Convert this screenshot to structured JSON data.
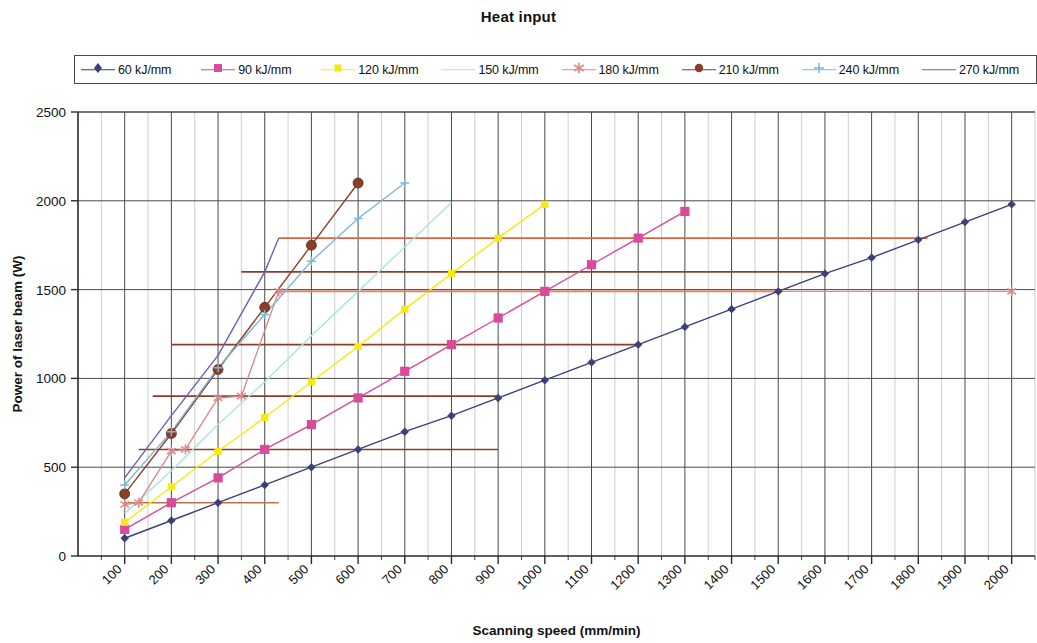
{
  "title": "Heat input",
  "legend": {
    "items": [
      {
        "label": "60 kJ/mm",
        "color": "#3b3f7a",
        "marker": "diamond"
      },
      {
        "label": "90 kJ/mm",
        "color": "#d94a9c",
        "marker": "square"
      },
      {
        "label": "120 kJ/mm",
        "color": "#f6ea12",
        "marker": "square-small"
      },
      {
        "label": "150 kJ/mm",
        "color": "#a8e4e4",
        "marker": "none"
      },
      {
        "label": "180 kJ/mm",
        "color": "#d98a8a",
        "marker": "star"
      },
      {
        "label": "210 kJ/mm",
        "color": "#8a3f2a",
        "marker": "circle"
      },
      {
        "label": "240 kJ/mm",
        "color": "#7fb7d4",
        "marker": "plus"
      },
      {
        "label": "270 kJ/mm",
        "color": "#6b62b5",
        "marker": "none"
      }
    ]
  },
  "chart_data": {
    "type": "line",
    "title": "Heat input",
    "xlabel": "Scanning speed (mm/min)",
    "ylabel": "Power of laser beam (W)",
    "xlim": [
      0,
      2050
    ],
    "ylim": [
      0,
      2500
    ],
    "xticks": [
      100,
      200,
      300,
      400,
      500,
      600,
      700,
      800,
      900,
      1000,
      1100,
      1200,
      1300,
      1400,
      1500,
      1600,
      1700,
      1800,
      1900,
      2000
    ],
    "yticks": [
      0,
      500,
      1000,
      1500,
      2000,
      2500
    ],
    "grid": true,
    "legend_position": "top",
    "series": [
      {
        "name": "60 kJ/mm",
        "color": "#3b3f7a",
        "marker": "diamond",
        "x": [
          100,
          200,
          300,
          400,
          500,
          600,
          700,
          800,
          900,
          1000,
          1100,
          1200,
          1300,
          1400,
          1500,
          1600,
          1700,
          1800,
          1900,
          2000
        ],
        "y": [
          100,
          200,
          300,
          400,
          500,
          600,
          700,
          790,
          890,
          990,
          1090,
          1190,
          1290,
          1390,
          1490,
          1590,
          1680,
          1780,
          1880,
          1980
        ]
      },
      {
        "name": "90 kJ/mm",
        "color": "#d94a9c",
        "marker": "square",
        "x": [
          100,
          200,
          300,
          400,
          500,
          600,
          700,
          800,
          900,
          1000,
          1100,
          1200,
          1300
        ],
        "y": [
          150,
          300,
          440,
          600,
          740,
          890,
          1040,
          1190,
          1340,
          1490,
          1640,
          1790,
          1940
        ]
      },
      {
        "name": "120 kJ/mm",
        "color": "#f6ea12",
        "marker": "square-small",
        "x": [
          100,
          200,
          300,
          400,
          500,
          600,
          700,
          800,
          900,
          1000
        ],
        "y": [
          190,
          390,
          590,
          780,
          980,
          1180,
          1390,
          1590,
          1790,
          1980
        ]
      },
      {
        "name": "150 kJ/mm",
        "color": "#a8e4e4",
        "marker": "none",
        "x": [
          100,
          200,
          300,
          400,
          500,
          600,
          700,
          800
        ],
        "y": [
          240,
          480,
          740,
          980,
          1240,
          1490,
          1740,
          1990
        ]
      },
      {
        "name": "180 kJ/mm",
        "color": "#d98a8a",
        "marker": "star",
        "x": [
          100,
          130,
          200,
          230,
          300,
          350,
          430,
          2000
        ],
        "y": [
          290,
          300,
          590,
          600,
          890,
          900,
          1490,
          1490
        ],
        "note": "rises then plateaus; also forms stepped horizontal segments at 300, 600, 900, 1190, 1490"
      },
      {
        "name": "210 kJ/mm",
        "color": "#8a3f2a",
        "marker": "circle",
        "x": [
          100,
          200,
          300,
          400,
          500,
          600
        ],
        "y": [
          350,
          690,
          1050,
          1400,
          1750,
          2100
        ]
      },
      {
        "name": "240 kJ/mm",
        "color": "#7fb7d4",
        "marker": "plus",
        "x": [
          100,
          200,
          300,
          400,
          500,
          600,
          700
        ],
        "y": [
          400,
          700,
          1060,
          1360,
          1660,
          1900,
          2100
        ]
      },
      {
        "name": "270 kJ/mm",
        "color": "#6b62b5",
        "marker": "none",
        "x": [
          100,
          200,
          300,
          400,
          430
        ],
        "y": [
          440,
          790,
          1130,
          1600,
          1790
        ]
      }
    ],
    "plateau_lines": [
      {
        "color": "#c0704a",
        "y": 300,
        "x_start": 100,
        "x_end": 430
      },
      {
        "color": "#8a3f2a",
        "y": 600,
        "x_start": 130,
        "x_end": 900
      },
      {
        "color": "#8a3f2a",
        "y": 900,
        "x_start": 160,
        "x_end": 900
      },
      {
        "color": "#8a3f2a",
        "y": 1190,
        "x_start": 200,
        "x_end": 1200
      },
      {
        "color": "#d9663f",
        "y": 1490,
        "x_start": 430,
        "x_end": 1500
      },
      {
        "color": "#8a3f2a",
        "y": 1600,
        "x_start": 350,
        "x_end": 1600
      },
      {
        "color": "#d9663f",
        "y": 1790,
        "x_start": 430,
        "x_end": 1820
      }
    ]
  }
}
